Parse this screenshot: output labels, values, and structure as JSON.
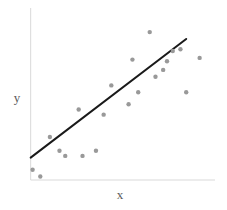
{
  "chart_data": {
    "type": "scatter",
    "title": "",
    "subtitle": "",
    "xlabel": "x",
    "ylabel": "y",
    "grid": false,
    "legend": null,
    "xlim": [
      0,
      100
    ],
    "ylim": [
      0,
      100
    ],
    "xticks": [],
    "yticks": [],
    "point_color": "#999999",
    "point_radius_px": 2.2,
    "axis_color": "#d9d9d9",
    "trendline_color": "#1a1a1a",
    "trendline_width_px": 2,
    "points": [
      {
        "x": 5,
        "y": 6
      },
      {
        "x": 9,
        "y": 2
      },
      {
        "x": 14,
        "y": 25
      },
      {
        "x": 19,
        "y": 17
      },
      {
        "x": 22,
        "y": 14
      },
      {
        "x": 29,
        "y": 41
      },
      {
        "x": 31,
        "y": 14
      },
      {
        "x": 38,
        "y": 17
      },
      {
        "x": 42,
        "y": 38
      },
      {
        "x": 46,
        "y": 55
      },
      {
        "x": 55,
        "y": 44
      },
      {
        "x": 57,
        "y": 70
      },
      {
        "x": 60,
        "y": 51
      },
      {
        "x": 66,
        "y": 86
      },
      {
        "x": 69,
        "y": 60
      },
      {
        "x": 73,
        "y": 64
      },
      {
        "x": 78,
        "y": 75
      },
      {
        "x": 82,
        "y": 76
      },
      {
        "x": 85,
        "y": 51
      },
      {
        "x": 92,
        "y": 71
      },
      {
        "x": 75,
        "y": 69
      }
    ],
    "trendline": {
      "type": "linear-fit",
      "x_start": 4,
      "y_start": 13,
      "x_end": 85,
      "y_end": 82
    },
    "axes": {
      "y_axis": {
        "x": 4,
        "y_bottom": 0,
        "y_top": 100
      },
      "x_axis": {
        "y": 0,
        "x_left": 4,
        "x_right": 100
      }
    }
  }
}
